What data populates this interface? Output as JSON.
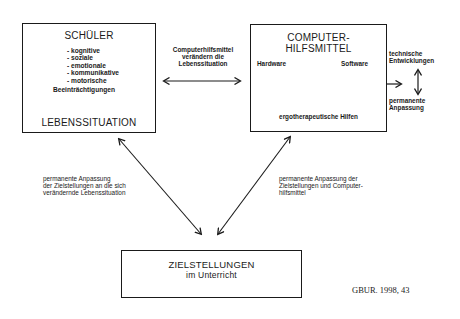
{
  "schueler_box": {
    "title": "SCHÜLER",
    "items": [
      "- kognitive",
      "- soziale",
      "- emotionale",
      "- kommunikative",
      "- motorische"
    ],
    "footer": "Beeinträchtigungen",
    "result": "LEBENSSITUATION"
  },
  "middle_label": {
    "line1": "Computerhilfsmittel",
    "line2": "verändern die",
    "line3": "Lebenssituation"
  },
  "computer_box": {
    "title_line1": "COMPUTER-",
    "title_line2": "HILFSMITTEL",
    "node_hardware": "Hardware",
    "node_software": "Software",
    "node_ergo": "ergotherapeutische Hilfen"
  },
  "right_side": {
    "top_line1": "technische",
    "top_line2": "Entwicklungen",
    "bottom_line1": "permanente",
    "bottom_line2": "Anpassung"
  },
  "left_diag_label": {
    "line1": "permanente Anpassung",
    "line2": "der Zielstellungen an die sich",
    "line3": "verändernde Lebenssituation"
  },
  "right_diag_label": {
    "line1": "permanente Anpassung der",
    "line2": "Zielstellungen und Computer-",
    "line3": "hilfsmittel"
  },
  "goals_box": {
    "line1": "ZIELSTELLUNGEN",
    "line2": "im Unterricht"
  },
  "citation": "GBUR. 1998, 43"
}
